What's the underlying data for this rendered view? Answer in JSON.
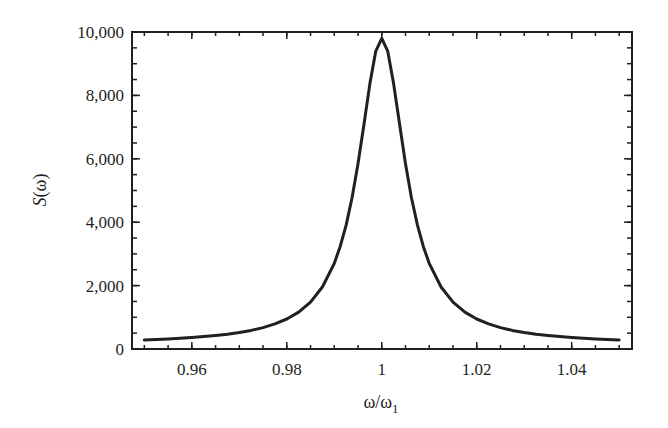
{
  "chart_data": {
    "type": "line",
    "title": "",
    "xlabel": "ω/ω1",
    "xlabel_main": "ω/ω",
    "xlabel_sub": "1",
    "ylabel": "S(ω)",
    "ylabel_italic": "S",
    "ylabel_rest": "(ω)",
    "xlim": [
      0.9474,
      1.0527
    ],
    "ylim": [
      0,
      10000
    ],
    "x_ticks": [
      0.96,
      0.98,
      1.0,
      1.02,
      1.04
    ],
    "x_tick_labels": [
      "0.96",
      "0.98",
      "1",
      "1.02",
      "1.04"
    ],
    "x_minor_step": 0.005,
    "y_ticks": [
      0,
      2000,
      4000,
      6000,
      8000,
      10000
    ],
    "y_tick_labels": [
      "0",
      "2,000",
      "4,000",
      "6,000",
      "8,000",
      "10,000"
    ],
    "y_minor_step": 500,
    "grid": false,
    "legend": null,
    "line_color": "#231f20",
    "series": [
      {
        "name": "S(ω)",
        "x": [
          0.95,
          0.9525,
          0.955,
          0.9575,
          0.96,
          0.9625,
          0.965,
          0.9675,
          0.97,
          0.9725,
          0.975,
          0.9775,
          0.98,
          0.9825,
          0.985,
          0.9875,
          0.99,
          0.99125,
          0.9925,
          0.99375,
          0.995,
          0.99625,
          0.9975,
          0.99875,
          1.0,
          1.00125,
          1.0025,
          1.00375,
          1.005,
          1.00625,
          1.0075,
          1.00875,
          1.01,
          1.0125,
          1.015,
          1.0175,
          1.02,
          1.0225,
          1.025,
          1.0275,
          1.03,
          1.0325,
          1.035,
          1.0375,
          1.04,
          1.0425,
          1.045,
          1.0475,
          1.05
        ],
        "y": [
          287,
          302,
          319,
          339,
          362,
          391,
          425,
          468,
          521,
          588,
          676,
          791,
          947,
          1165,
          1481,
          1957,
          2704,
          3236,
          3916,
          4778,
          5845,
          7089,
          8372,
          9399,
          9800,
          9399,
          8372,
          7089,
          5845,
          4778,
          3916,
          3236,
          2704,
          1957,
          1481,
          1165,
          947,
          791,
          676,
          588,
          521,
          468,
          425,
          391,
          362,
          339,
          319,
          302,
          287
        ]
      }
    ]
  }
}
